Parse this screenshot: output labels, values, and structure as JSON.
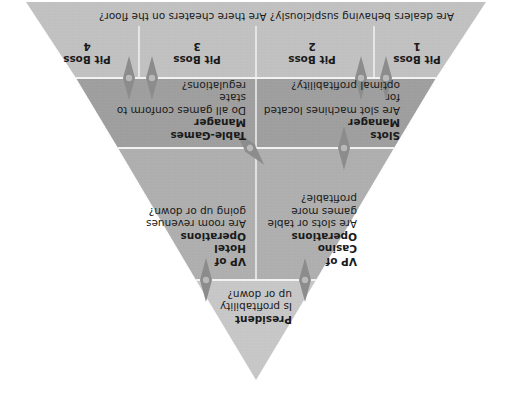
{
  "diagram": {
    "orientation": "rotated 180 degrees (upside down)",
    "colors": {
      "level_president": "#c8c8c8",
      "level_vp": "#b0b0b0",
      "level_manager": "#a0a0a0",
      "level_pitboss": "#c2c2c2",
      "divider": "#f2f2f2",
      "arrow": "#8c8c8c"
    },
    "levels": [
      {
        "id": "president",
        "nodes": [
          {
            "title": "President",
            "question": "Is profitability up or down?"
          }
        ]
      },
      {
        "id": "vp",
        "nodes": [
          {
            "title": "VP of Casino Operations",
            "title_lines": [
              "VP of",
              "Casino",
              "Operations"
            ],
            "question": "Are slots or table games more profitable?",
            "question_lines": [
              "Are slots or table",
              "games more profitable?"
            ]
          },
          {
            "title": "VP of Hotel Operations",
            "title_lines": [
              "VP of",
              "Hotel",
              "Operations"
            ],
            "question": "Are room revenues going up or down?",
            "question_lines": [
              "Are room revenues",
              "going up or down?"
            ]
          }
        ]
      },
      {
        "id": "manager",
        "nodes": [
          {
            "title": "Slots Manager",
            "title_lines": [
              "Slots",
              "Manager"
            ],
            "question": "Are slot machines located for optimal profitability?",
            "question_lines": [
              "Are slot machines located for",
              "optimal profitability?"
            ]
          },
          {
            "title": "Table-Games Manager",
            "title_lines": [
              "Table-Games",
              "Manager"
            ],
            "question": "Do all games conform to state regulations?",
            "question_lines": [
              "Do all games conform to state",
              "regulations?"
            ]
          }
        ]
      },
      {
        "id": "pitboss",
        "nodes": [
          {
            "title": "Pit Boss 1",
            "title_lines": [
              "Pit Boss",
              "1"
            ]
          },
          {
            "title": "Pit Boss 2",
            "title_lines": [
              "Pit Boss",
              "2"
            ]
          },
          {
            "title": "Pit Boss 3",
            "title_lines": [
              "Pit Boss",
              "3"
            ]
          },
          {
            "title": "Pit Boss 4",
            "title_lines": [
              "Pit Boss",
              "4"
            ]
          }
        ],
        "shared_questions": [
          "Are dealers behaving suspiciously?",
          "Are there cheaters on the floor?"
        ]
      }
    ]
  }
}
